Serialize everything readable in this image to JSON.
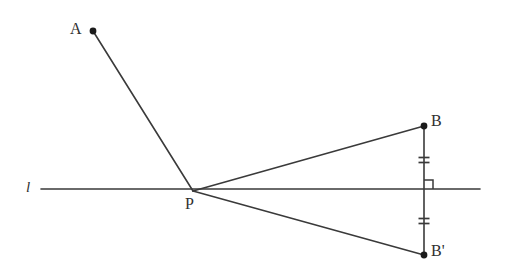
{
  "figure": {
    "kind": "geometry-diagram",
    "background_color": "#ffffff",
    "stroke_color": "#3a3a3a",
    "label_color": "#2f2f2f",
    "canvas": {
      "width": 509,
      "height": 276
    },
    "labels": {
      "line_l": "l",
      "point_A": "A",
      "point_P": "P",
      "point_B": "B",
      "point_B_prime": "B'"
    },
    "points": [
      {
        "name": "A",
        "label": "A",
        "x": 93,
        "y": 31,
        "dot": true
      },
      {
        "name": "P",
        "label": "P",
        "x": 193,
        "y": 191,
        "dot": false
      },
      {
        "name": "B",
        "label": "B",
        "x": 424,
        "y": 126,
        "dot": true
      },
      {
        "name": "B'",
        "label": "B'",
        "x": 424,
        "y": 255,
        "dot": true
      }
    ],
    "segments": [
      {
        "name": "line-l",
        "from": [
          41,
          189
        ],
        "to": [
          480,
          189
        ]
      },
      {
        "name": "segment-AP",
        "from": [
          93,
          31
        ],
        "to": [
          193,
          191
        ]
      },
      {
        "name": "segment-PB",
        "from": [
          193,
          191
        ],
        "to": [
          424,
          126
        ]
      },
      {
        "name": "segment-PBp",
        "from": [
          193,
          191
        ],
        "to": [
          424,
          255
        ]
      },
      {
        "name": "segment-BBp",
        "from": [
          424,
          126
        ],
        "to": [
          424,
          255
        ]
      }
    ],
    "right_angle_marker": {
      "name": "right-angle-square",
      "x": 424,
      "y": 189,
      "size": 9,
      "quadrant": "upper-right"
    },
    "tick_marks": [
      {
        "name": "tick-upper",
        "cx": 424,
        "cy": 160,
        "count": 2,
        "width": 11,
        "gap": 5
      },
      {
        "name": "tick-lower",
        "cx": 424,
        "cy": 221,
        "count": 2,
        "width": 11,
        "gap": 5
      }
    ]
  }
}
